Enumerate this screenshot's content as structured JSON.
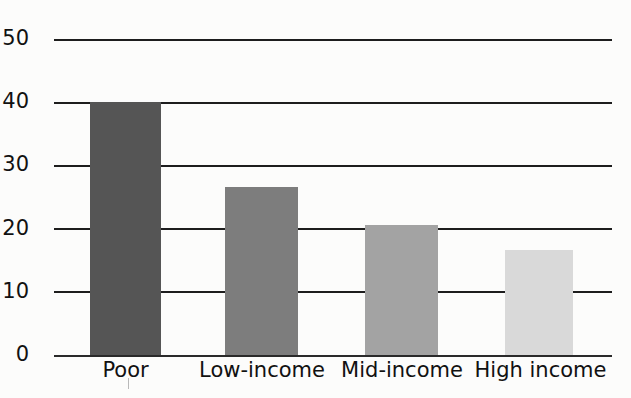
{
  "chart_data": {
    "type": "bar",
    "title": "",
    "subtitle": "",
    "xlabel": "",
    "ylabel": "",
    "categories": [
      "Poor",
      "Low-income",
      "Mid-income",
      "High income"
    ],
    "values": [
      40,
      26.5,
      20.5,
      16.5
    ],
    "series": [
      {
        "name": "Percent",
        "values": [
          40,
          26.5,
          20.5,
          16.5
        ]
      }
    ],
    "bar_colors": [
      "#555555",
      "#7d7d7d",
      "#a3a3a3",
      "#d9d9d9"
    ],
    "ylim": [
      0,
      50
    ],
    "yticks": [
      0,
      10,
      20,
      30,
      40,
      50
    ],
    "ytick_labels": [
      "0",
      "10",
      "20",
      "30",
      "40",
      "50"
    ],
    "grid": true,
    "grid_color": "#1d1d1d",
    "legend": null,
    "legend_position": "none",
    "annotations": [],
    "background_color": "#fcfcfb",
    "text_color": "#111111"
  },
  "axis": {
    "y_labels": [
      "50",
      "40",
      "30",
      "20",
      "10",
      "0"
    ],
    "x_labels": [
      "Poor",
      "Low-income",
      "Mid-income",
      "High income"
    ]
  }
}
